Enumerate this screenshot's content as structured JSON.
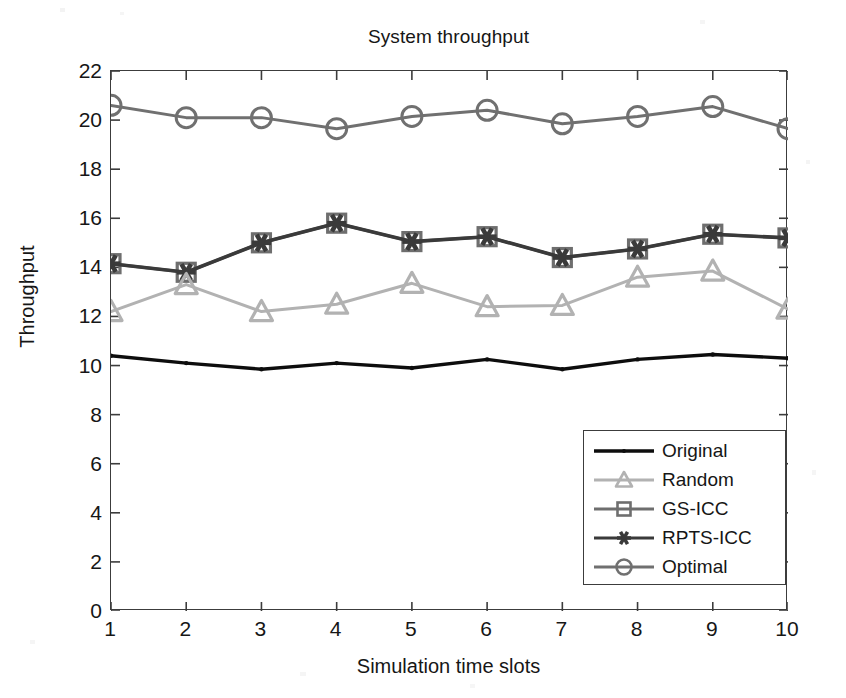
{
  "chart_data": {
    "type": "line",
    "title": "System throughput",
    "xlabel": "Simulation time slots",
    "ylabel": "Throughput",
    "x": [
      1,
      2,
      3,
      4,
      5,
      6,
      7,
      8,
      9,
      10
    ],
    "categories": [
      "1",
      "2",
      "3",
      "4",
      "5",
      "6",
      "7",
      "8",
      "9",
      "10"
    ],
    "xlim": [
      1,
      10
    ],
    "ylim": [
      0,
      22
    ],
    "xticks": [
      "1",
      "2",
      "3",
      "4",
      "5",
      "6",
      "7",
      "8",
      "9",
      "10"
    ],
    "yticks": [
      "0",
      "2",
      "4",
      "6",
      "8",
      "10",
      "12",
      "14",
      "16",
      "18",
      "20",
      "22"
    ],
    "grid": false,
    "legend_position": "lower-right",
    "series": [
      {
        "name": "Original",
        "marker": "dot",
        "color": "#0d0d0d",
        "values": [
          10.4,
          10.1,
          9.85,
          10.1,
          9.9,
          10.25,
          9.85,
          10.25,
          10.45,
          10.3
        ]
      },
      {
        "name": "Random",
        "marker": "triangle",
        "color": "#b2b2b2",
        "values": [
          12.2,
          13.3,
          12.2,
          12.5,
          13.35,
          12.4,
          12.45,
          13.6,
          13.85,
          12.3
        ]
      },
      {
        "name": "GS-ICC",
        "marker": "square-open",
        "color": "#6e6e6e",
        "values": [
          14.15,
          13.8,
          15.0,
          15.8,
          15.05,
          15.25,
          14.4,
          14.75,
          15.35,
          15.2
        ]
      },
      {
        "name": "RPTS-ICC",
        "marker": "asterisk",
        "color": "#3a3a3a",
        "values": [
          14.15,
          13.8,
          15.0,
          15.8,
          15.05,
          15.25,
          14.4,
          14.75,
          15.35,
          15.2
        ]
      },
      {
        "name": "Optimal",
        "marker": "circle-open",
        "color": "#707070",
        "values": [
          20.6,
          20.1,
          20.1,
          19.65,
          20.15,
          20.4,
          19.85,
          20.15,
          20.55,
          19.65
        ]
      }
    ]
  },
  "legend": {
    "items": [
      {
        "label": "Original",
        "marker": "dot",
        "color": "#0d0d0d"
      },
      {
        "label": "Random",
        "marker": "triangle",
        "color": "#b2b2b2"
      },
      {
        "label": "GS-ICC",
        "marker": "square-open",
        "color": "#6e6e6e"
      },
      {
        "label": "RPTS-ICC",
        "marker": "asterisk",
        "color": "#3a3a3a"
      },
      {
        "label": "Optimal",
        "marker": "circle-open",
        "color": "#707070"
      }
    ]
  },
  "colors": {
    "axis": "#3c3c3c",
    "text": "#161616",
    "background": "#ffffff"
  }
}
